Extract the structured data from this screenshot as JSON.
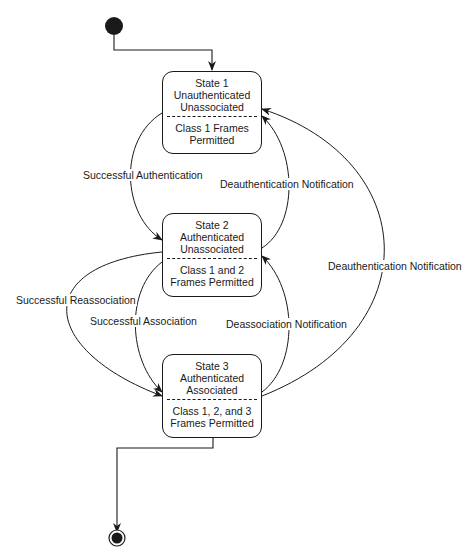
{
  "diagram": {
    "type": "state-machine",
    "states": [
      {
        "id": "state1",
        "name": "State 1",
        "lines": [
          "Unauthenticated",
          "Unassociated"
        ],
        "frames": [
          "Class 1 Frames",
          "Permitted"
        ]
      },
      {
        "id": "state2",
        "name": "State 2",
        "lines": [
          "Authenticated",
          "Unassociated"
        ],
        "frames": [
          "Class 1 and 2",
          "Frames Permitted"
        ]
      },
      {
        "id": "state3",
        "name": "State 3",
        "lines": [
          "Authenticated",
          "Associated"
        ],
        "frames": [
          "Class 1, 2, and 3",
          "Frames Permitted"
        ]
      }
    ],
    "transitions": [
      {
        "from": "initial",
        "to": "state1",
        "label": ""
      },
      {
        "from": "state1",
        "to": "state2",
        "label": "Successful Authentication"
      },
      {
        "from": "state2",
        "to": "state1",
        "label": "Deauthentication Notification"
      },
      {
        "from": "state2",
        "to": "state3",
        "label": "Successful Association"
      },
      {
        "from": "state2",
        "to": "state3",
        "label": "Successful Reassociation"
      },
      {
        "from": "state3",
        "to": "state2",
        "label": "Deassociation Notification"
      },
      {
        "from": "state3",
        "to": "state1",
        "label": "Deauthentication Notification"
      },
      {
        "from": "state3",
        "to": "final",
        "label": ""
      }
    ]
  }
}
